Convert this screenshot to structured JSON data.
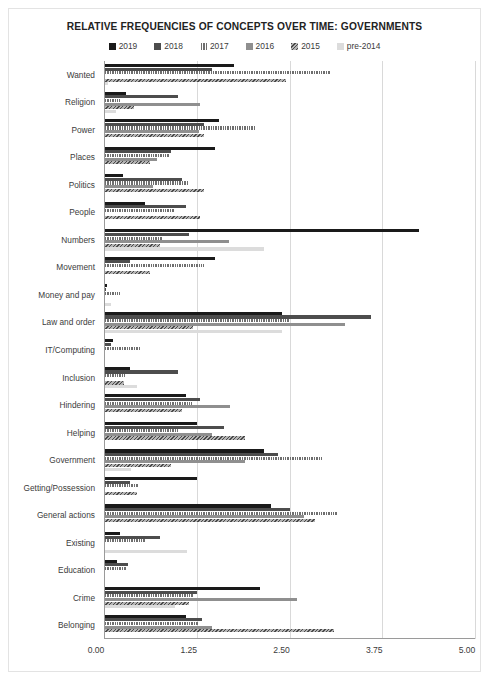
{
  "chart_data": {
    "type": "bar",
    "orientation": "horizontal",
    "title": "RELATIVE FREQUENCIES OF CONCEPTS OVER TIME: GOVERNMENTS",
    "xlabel": "",
    "ylabel": "",
    "xlim": [
      0,
      5
    ],
    "xticks": [
      "0.00",
      "1.25",
      "2.50",
      "3.75",
      "5.00"
    ],
    "xtick_values": [
      0,
      1.25,
      2.5,
      3.75,
      5
    ],
    "grid": true,
    "legend_position": "top",
    "categories": [
      "Wanted",
      "Religion",
      "Power",
      "Places",
      "Politics",
      "People",
      "Numbers",
      "Movement",
      "Money and pay",
      "Law and order",
      "IT/Computing",
      "Inclusion",
      "Hindering",
      "Helping",
      "Government",
      "Getting/Possession",
      "General actions",
      "Existing",
      "Education",
      "Crime",
      "Belonging"
    ],
    "series": [
      {
        "name": "2019",
        "color": "#1a1a1a",
        "values": [
          1.75,
          0.3,
          1.55,
          1.5,
          0.25,
          0.55,
          4.25,
          1.5,
          0.04,
          2.4,
          0.12,
          0.35,
          1.1,
          1.25,
          2.15,
          1.25,
          2.25,
          0.22,
          0.18,
          2.1,
          1.1
        ]
      },
      {
        "name": "2018",
        "color": "#4d4d4d",
        "values": [
          1.45,
          1.0,
          1.35,
          0.9,
          1.05,
          1.1,
          1.15,
          0.35,
          0.03,
          3.6,
          0.1,
          1.0,
          1.3,
          1.62,
          2.35,
          0.35,
          2.5,
          0.75,
          0.33,
          1.25,
          1.32
        ]
      },
      {
        "name": "2017",
        "color": "#6e6e6e",
        "values": [
          3.05,
          0.22,
          2.05,
          0.88,
          1.15,
          0.95,
          0.8,
          1.35,
          0.22,
          2.5,
          0.5,
          0.28,
          1.18,
          1.0,
          2.95,
          0.47,
          3.15,
          0.55,
          0.3,
          1.2,
          1.28
        ]
      },
      {
        "name": "2016",
        "color": "#8f8f8f",
        "values": [
          0.0,
          1.3,
          1.28,
          0.72,
          0.66,
          0.0,
          1.68,
          0.0,
          0.0,
          3.25,
          0.0,
          0.0,
          1.7,
          1.45,
          1.9,
          0.0,
          2.7,
          0.0,
          0.0,
          2.6,
          1.45
        ]
      },
      {
        "name": "2015",
        "color": "#b4b4b4",
        "values": [
          2.45,
          0.4,
          1.35,
          0.62,
          1.35,
          1.3,
          0.76,
          0.62,
          0.0,
          1.2,
          0.0,
          0.27,
          1.05,
          1.9,
          0.9,
          0.45,
          2.85,
          0.0,
          0.0,
          1.15,
          3.1
        ]
      },
      {
        "name": "pre-2014",
        "color": "#dcdcdc",
        "values": [
          0.05,
          0.16,
          0.0,
          0.0,
          0.0,
          0.0,
          2.15,
          0.0,
          0.1,
          2.4,
          0.0,
          0.44,
          0.0,
          0.0,
          0.37,
          0.0,
          0.0,
          1.12,
          0.0,
          0.96,
          0.0
        ]
      }
    ]
  },
  "legend": {
    "items": [
      {
        "label": "2019"
      },
      {
        "label": "2018"
      },
      {
        "label": "2017"
      },
      {
        "label": "2016"
      },
      {
        "label": "2015"
      },
      {
        "label": "pre-2014"
      }
    ]
  }
}
